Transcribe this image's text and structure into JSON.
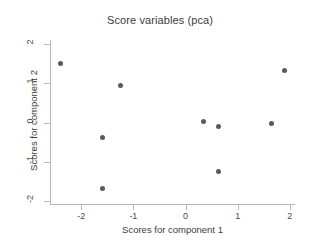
{
  "chart_data": {
    "type": "scatter",
    "title": "Score variables (pca)",
    "xlabel": "Scores for component 1",
    "ylabel": "Scores for component 2",
    "xlim": [
      -2.6,
      2.1
    ],
    "ylim": [
      -2.1,
      2.1
    ],
    "grid": false,
    "legend": null,
    "xticks": [
      "-2",
      "-1",
      "0",
      "1",
      "2"
    ],
    "xtickvalues": [
      -2,
      -1,
      0,
      1,
      2
    ],
    "yticks": [
      "2",
      "1",
      "0",
      "-1",
      "-2"
    ],
    "ytickvalues": [
      2,
      1,
      0,
      -1,
      -2
    ],
    "marker_color": "#5a5a5a",
    "axis_color": "#b9b9b9",
    "background": "#ffffff",
    "points": [
      {
        "x": -2.4,
        "y": 1.5
      },
      {
        "x": -1.6,
        "y": -0.38
      },
      {
        "x": -1.6,
        "y": -1.68
      },
      {
        "x": -1.25,
        "y": 0.93
      },
      {
        "x": 0.35,
        "y": 0.02
      },
      {
        "x": 0.63,
        "y": -0.1
      },
      {
        "x": 0.63,
        "y": -1.25
      },
      {
        "x": 1.65,
        "y": -0.03
      },
      {
        "x": 1.9,
        "y": 1.33
      }
    ]
  }
}
